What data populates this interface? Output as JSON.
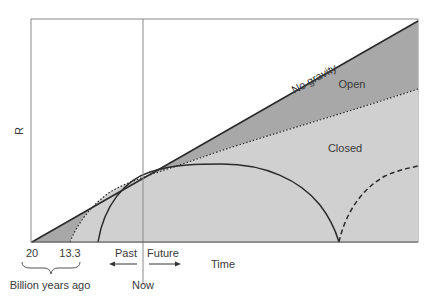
{
  "figure": {
    "y_axis_label": "R",
    "x_axis_label": "Time",
    "region_labels": {
      "no_gravity": "No gravity",
      "open": "Open",
      "closed": "Closed"
    },
    "ticks": {
      "t20": "20",
      "t13": "13.3",
      "brace_label": "Billion years ago",
      "now": "Now",
      "past": "Past",
      "future": "Future"
    },
    "colors": {
      "open_fill": "#a8a8a8",
      "closed_fill": "#d0d0d0",
      "line": "#2a2a2a",
      "frame": "#8a8a8a"
    }
  }
}
